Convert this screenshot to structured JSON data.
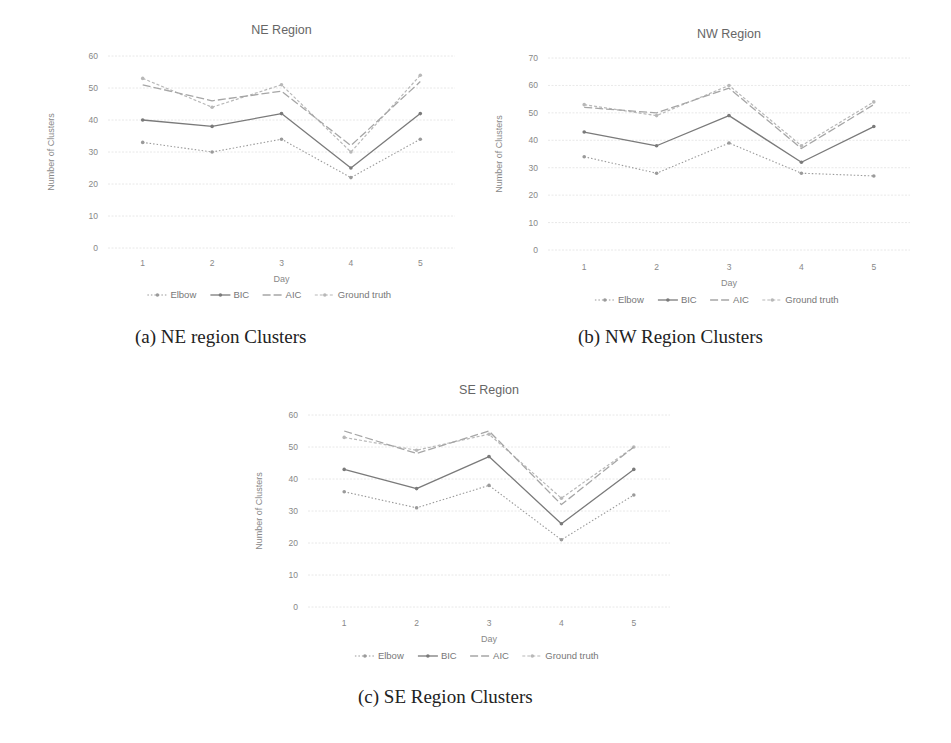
{
  "series_styles": {
    "Elbow": {
      "color": "#9a9a9a",
      "dash": "1.5 2",
      "width": 1.1,
      "marker": true
    },
    "BIC": {
      "color": "#7a7a7a",
      "dash": "",
      "width": 1.3,
      "marker": true
    },
    "AIC": {
      "color": "#a6a6a6",
      "dash": "8 3",
      "width": 1.3,
      "marker": false
    },
    "Ground truth": {
      "color": "#b8b8b8",
      "dash": "3 2",
      "width": 1.2,
      "marker": true
    }
  },
  "captions": {
    "a": "(a) NE region Clusters",
    "b": "(b) NW Region Clusters",
    "c": "(c) SE Region Clusters"
  },
  "chart_data": [
    {
      "id": "ne",
      "type": "line",
      "title": "NE Region",
      "xlabel": "Day",
      "ylabel": "Number of Clusters",
      "categories": [
        "1",
        "2",
        "3",
        "4",
        "5"
      ],
      "ylim": [
        0,
        60
      ],
      "yticks": [
        0,
        10,
        20,
        30,
        40,
        50,
        60
      ],
      "grid": true,
      "legend_position": "bottom",
      "legend": [
        "Elbow",
        "BIC",
        "AIC",
        "Ground truth"
      ],
      "series": [
        {
          "name": "Elbow",
          "values": [
            33,
            30,
            34,
            22,
            34
          ]
        },
        {
          "name": "BIC",
          "values": [
            40,
            38,
            42,
            25,
            42
          ]
        },
        {
          "name": "AIC",
          "values": [
            51,
            46,
            49,
            32,
            52
          ]
        },
        {
          "name": "Ground truth",
          "values": [
            53,
            44,
            51,
            30,
            54
          ]
        }
      ]
    },
    {
      "id": "nw",
      "type": "line",
      "title": "NW Region",
      "xlabel": "Day",
      "ylabel": "Number of Clusters",
      "categories": [
        "1",
        "2",
        "3",
        "4",
        "5"
      ],
      "ylim": [
        0,
        70
      ],
      "yticks": [
        0,
        10,
        20,
        30,
        40,
        50,
        60,
        70
      ],
      "grid": true,
      "legend_position": "bottom",
      "legend": [
        "Elbow",
        "BIC",
        "AIC",
        "Ground truth"
      ],
      "series": [
        {
          "name": "Elbow",
          "values": [
            34,
            28,
            39,
            28,
            27
          ]
        },
        {
          "name": "BIC",
          "values": [
            43,
            38,
            49,
            32,
            45
          ]
        },
        {
          "name": "AIC",
          "values": [
            52,
            50,
            59,
            37,
            53
          ]
        },
        {
          "name": "Ground truth",
          "values": [
            53,
            49,
            60,
            38,
            54
          ]
        }
      ]
    },
    {
      "id": "se",
      "type": "line",
      "title": "SE Region",
      "xlabel": "Day",
      "ylabel": "Number of Clusters",
      "categories": [
        "1",
        "2",
        "3",
        "4",
        "5"
      ],
      "ylim": [
        0,
        60
      ],
      "yticks": [
        0,
        10,
        20,
        30,
        40,
        50,
        60
      ],
      "grid": true,
      "legend_position": "bottom",
      "legend": [
        "Elbow",
        "BIC",
        "AIC",
        "Ground truth"
      ],
      "series": [
        {
          "name": "Elbow",
          "values": [
            36,
            31,
            38,
            21,
            35
          ]
        },
        {
          "name": "BIC",
          "values": [
            43,
            37,
            47,
            26,
            43
          ]
        },
        {
          "name": "AIC",
          "values": [
            55,
            48,
            55,
            32,
            50
          ]
        },
        {
          "name": "Ground truth",
          "values": [
            53,
            49,
            54,
            34,
            50
          ]
        }
      ]
    }
  ]
}
